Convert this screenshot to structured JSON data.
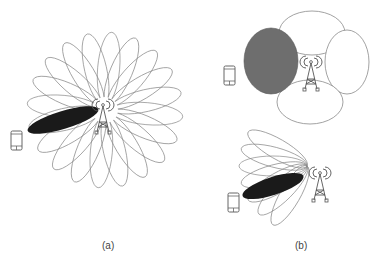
{
  "panels": [
    {
      "id": "a",
      "label": "(a)",
      "description": "Omnidirectional beam sweep: many narrow beams around base station, one beam (black) directed at user device"
    },
    {
      "id": "b",
      "label": "(b)",
      "description": "Top: few wide beams with one selected (gray); Bottom: fan of narrow beams with one selected (black) toward user device"
    }
  ],
  "colors": {
    "outline": "#8a8a8a",
    "selected_narrow": "#1a1a1a",
    "selected_wide": "#6e6e6e",
    "background": "#ffffff"
  },
  "icons": [
    "base-station-tower-icon",
    "smartphone-icon"
  ]
}
